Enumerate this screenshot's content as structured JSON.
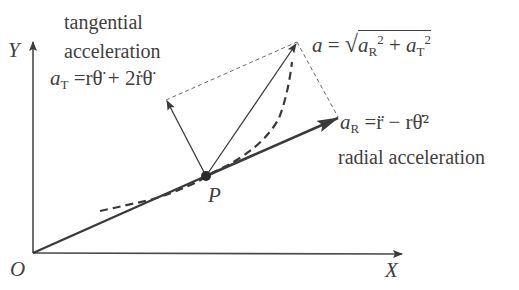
{
  "diagram": {
    "axes": {
      "x_label": "X",
      "y_label": "Y",
      "origin_label": "O"
    },
    "point": {
      "label": "P"
    },
    "tangential": {
      "title_line1": "tangential",
      "title_line2": "acceleration",
      "formula_lhs": "a",
      "formula_sub": "T",
      "formula_rhs": "=rθ̈ + 2ṙθ̈"
    },
    "radial": {
      "title": "radial acceleration",
      "formula_lhs": "a",
      "formula_sub": "R",
      "formula_rhs": "=r̈ − rθ̇²"
    },
    "total": {
      "formula_lhs": "a",
      "formula_eq": "=",
      "sqrt_a1": "a",
      "sqrt_sub1": "R",
      "sqrt_sup1": "2",
      "plus": "+",
      "sqrt_a2": "a",
      "sqrt_sub2": "T",
      "sqrt_sup2": "2"
    },
    "colors": {
      "ink": "#3a3a3a",
      "background": "#ffffff"
    }
  }
}
